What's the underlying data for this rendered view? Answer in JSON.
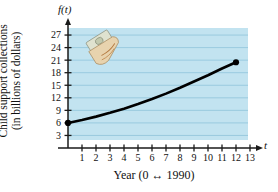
{
  "figure": {
    "y_axis_title_line1": "Child support collections",
    "y_axis_title_line2": "(in billions of dollars)",
    "y_axis_symbol": "f(t)",
    "x_axis_symbol": "t",
    "x_axis_title": "Year (0 ↔ 1990)",
    "clipart_name": "hand-holding-money-icon"
  },
  "colors": {
    "plot_background": "#c2e3f0",
    "gridline": "#8fc4da",
    "axis": "#1a1a1a",
    "curve": "#000000",
    "page_background": "#ffffff"
  },
  "chart_data": {
    "type": "line",
    "title": "",
    "subtitle": "",
    "xlabel": "Year (0 ↔ 1990)",
    "ylabel": "Child support collections (in billions of dollars)",
    "xlim": [
      0,
      13.5
    ],
    "ylim": [
      0,
      28.5
    ],
    "grid": true,
    "legend": "none",
    "xticks": [
      1,
      2,
      3,
      4,
      5,
      6,
      7,
      8,
      9,
      10,
      11,
      12,
      13
    ],
    "yticks": [
      3,
      6,
      9,
      12,
      15,
      18,
      21,
      24,
      27
    ],
    "endpoint_markers": [
      {
        "x": 0,
        "y": 6
      },
      {
        "x": 12,
        "y": 20.5
      }
    ],
    "series": [
      {
        "name": "Child support collections",
        "x": [
          0,
          1,
          2,
          3,
          4,
          5,
          6,
          7,
          8,
          9,
          10,
          11,
          12
        ],
        "values": [
          6.0,
          6.7,
          7.5,
          8.4,
          9.4,
          10.5,
          11.7,
          13.0,
          14.4,
          15.9,
          17.4,
          19.0,
          20.5
        ]
      }
    ],
    "annotations": [
      {
        "name": "hand-holding-money-clipart",
        "x": 2.0,
        "y": 23.0,
        "text": ""
      }
    ]
  }
}
